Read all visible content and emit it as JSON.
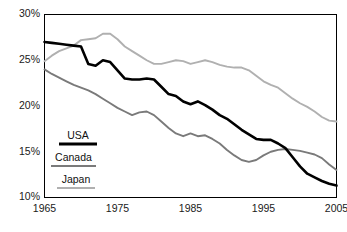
{
  "chart_data": {
    "type": "line",
    "title": "",
    "xlabel": "",
    "ylabel": "",
    "xlim": [
      1965,
      2005
    ],
    "ylim": [
      10,
      30
    ],
    "grid": false,
    "legend_position": "inside-lower-left",
    "x_ticks": [
      "1965",
      "1975",
      "1985",
      "1995",
      "2005"
    ],
    "x_tick_values": [
      1965,
      1975,
      1985,
      1995,
      2005
    ],
    "y_ticks": [
      "10%",
      "15%",
      "20%",
      "25%",
      "30%"
    ],
    "y_tick_values": [
      10,
      15,
      20,
      25,
      30
    ],
    "x": [
      1965,
      1966,
      1967,
      1968,
      1969,
      1970,
      1971,
      1972,
      1973,
      1974,
      1975,
      1976,
      1977,
      1978,
      1979,
      1980,
      1981,
      1982,
      1983,
      1984,
      1985,
      1986,
      1987,
      1988,
      1989,
      1990,
      1991,
      1992,
      1993,
      1994,
      1995,
      1996,
      1997,
      1998,
      1999,
      2000,
      2001,
      2002,
      2003,
      2004,
      2005
    ],
    "series": [
      {
        "name": "USA",
        "color": "#000000",
        "stroke_width": 2.6,
        "values": [
          27.0,
          26.9,
          26.8,
          26.7,
          26.6,
          26.5,
          24.6,
          24.4,
          25.0,
          24.8,
          23.9,
          23.0,
          22.9,
          22.9,
          23.0,
          22.9,
          22.1,
          21.3,
          21.1,
          20.5,
          20.2,
          20.5,
          20.1,
          19.6,
          19.0,
          18.6,
          18.0,
          17.4,
          16.9,
          16.4,
          16.3,
          16.3,
          15.9,
          15.4,
          14.4,
          13.4,
          12.6,
          12.2,
          11.8,
          11.5,
          11.3
        ]
      },
      {
        "name": "Canada",
        "color": "#7a7a7a",
        "stroke_width": 1.9,
        "values": [
          24.0,
          23.5,
          23.1,
          22.7,
          22.3,
          22.0,
          21.7,
          21.3,
          20.8,
          20.3,
          19.8,
          19.4,
          19.0,
          19.3,
          19.4,
          19.0,
          18.3,
          17.6,
          17.0,
          16.7,
          17.0,
          16.7,
          16.8,
          16.4,
          15.9,
          15.2,
          14.6,
          14.1,
          13.9,
          14.1,
          14.6,
          15.0,
          15.2,
          15.3,
          15.2,
          15.1,
          14.9,
          14.7,
          14.3,
          13.6,
          13.0
        ]
      },
      {
        "name": "Japan",
        "color": "#b0b0b0",
        "stroke_width": 1.9,
        "values": [
          24.9,
          25.5,
          26.0,
          26.3,
          26.6,
          27.2,
          27.3,
          27.4,
          27.9,
          27.9,
          27.3,
          26.5,
          26.0,
          25.5,
          25.0,
          24.6,
          24.6,
          24.8,
          25.0,
          24.9,
          24.6,
          24.8,
          25.0,
          24.8,
          24.5,
          24.3,
          24.2,
          24.2,
          23.9,
          23.3,
          22.7,
          22.3,
          22.0,
          21.4,
          20.8,
          20.3,
          19.9,
          19.4,
          18.8,
          18.4,
          18.3
        ]
      }
    ],
    "legend": [
      {
        "label": "USA",
        "color": "#000000"
      },
      {
        "label": "Canada",
        "color": "#7a7a7a"
      },
      {
        "label": "Japan",
        "color": "#b0b0b0"
      }
    ]
  },
  "axes": {
    "frame_color": "#000000"
  }
}
